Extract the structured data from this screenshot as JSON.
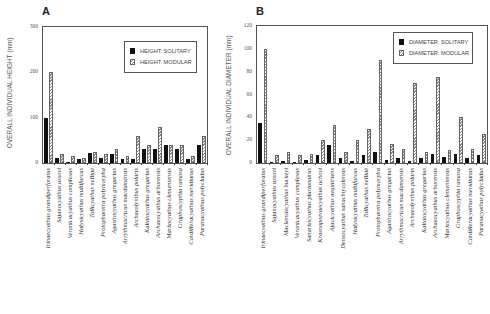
{
  "chart_data": [
    {
      "panel": "A",
      "type": "bar",
      "title": "",
      "xlabel": "",
      "ylabel": "OVERALL INDIVIDUAL HEIGHT (mm)",
      "ylim": [
        0,
        300
      ],
      "yticks": [
        0,
        100,
        200,
        300
      ],
      "grid": false,
      "legend_position": "upper right",
      "categories": [
        "Irinaecyathus grandiperforatus",
        "Sajanocyathus ussovi",
        "Veronicacyathus complexus",
        "Halysicyathus multifurcus",
        "Tollicyathus nelliae",
        "Protopharetra polymorpha",
        "Agastrocyathus gregarius",
        "Arrythmocricus macdamensis",
        "Archaeolynthus polaris",
        "Kaltatocyathus gregarius",
        "Archaeocyathus arborensis",
        "Markocyathus clementensis",
        "Graphoscyphia ramosa",
        "Cordilleracyathus meridianus",
        "Paranacyathus polycladus"
      ],
      "series": [
        {
          "name": "HEIGHT: SOLITARY",
          "style": "solid",
          "color": "#111111",
          "values": [
            100,
            10,
            3,
            8,
            22,
            10,
            20,
            9,
            8,
            30,
            30,
            40,
            30,
            9,
            40
          ]
        },
        {
          "name": "HEIGHT: MODULAR",
          "style": "hatched",
          "color": "#8a8a8a",
          "values": [
            200,
            20,
            15,
            11,
            25,
            20,
            32,
            15,
            60,
            40,
            80,
            40,
            40,
            15,
            60
          ]
        }
      ]
    },
    {
      "panel": "B",
      "type": "bar",
      "title": "",
      "xlabel": "",
      "ylabel": "OVERALL INDIVIDUAL DIAMETER (mm)",
      "ylim": [
        0,
        120
      ],
      "yticks": [
        0,
        20,
        40,
        60,
        80,
        100,
        120
      ],
      "grid": false,
      "legend_position": "upper right",
      "categories": [
        "Irinaecyathus grandiperforatus",
        "Sajanocyathus ussovi",
        "Mackenziecyathus buckeyi",
        "Veronicacyathus complexus",
        "Sanarkocyathus pluriumurus",
        "Krasnopeevaecyathus uchovi",
        "Ajacicyathus aequitriens",
        "Densocyathus sanachtycolensis",
        "Halysicyathus multifurcus",
        "Tollicyathus nelliae",
        "Protopharetra polymorpha",
        "Agastrocyathus gregarius",
        "Arrythmocricus macdamensis",
        "Archaeolynthus polaris",
        "Kaltatocyathus gregarius",
        "Archaeocyathus arborensis",
        "Markocyathus clementensis",
        "Graphoscyphia ramosa",
        "Cordilleracyathus meridianus",
        "Paranacyathus polycladus"
      ],
      "series": [
        {
          "name": "DIAMETER: SOLITARY",
          "style": "solid",
          "color": "#111111",
          "values": [
            35,
            1,
            2,
            1,
            3,
            7,
            16,
            4,
            2,
            7,
            10,
            3,
            4,
            2,
            4,
            8,
            5,
            8,
            4,
            7
          ]
        },
        {
          "name": "DIAMETER: MODULAR",
          "style": "hatched",
          "color": "#8a8a8a",
          "values": [
            100,
            7,
            10,
            7,
            8,
            20,
            33,
            10,
            20,
            30,
            90,
            17,
            12,
            70,
            10,
            75,
            11,
            40,
            12,
            25
          ]
        }
      ]
    }
  ],
  "panels": {
    "a": {
      "letter": "A",
      "ylabel": "OVERALL INDIVIDUAL HEIGHT (mm)",
      "legend": [
        "HEIGHT: SOLITARY",
        "HEIGHT: MODULAR"
      ]
    },
    "b": {
      "letter": "B",
      "ylabel": "OVERALL INDIVIDUAL DIAMETER (mm)",
      "legend": [
        "DIAMETER: SOLITARY",
        "DIAMETER: MODULAR"
      ]
    }
  }
}
